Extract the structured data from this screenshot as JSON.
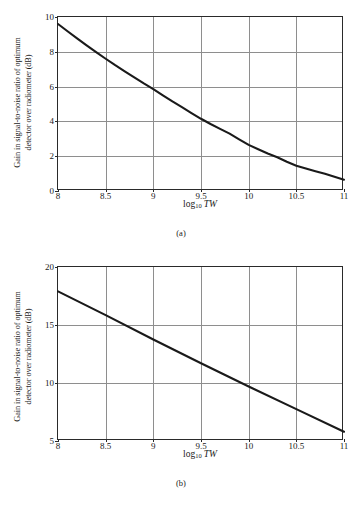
{
  "figure": {
    "panels": [
      {
        "id": "a",
        "caption": "(a)",
        "ylabel_line1": "Gain in signal-to-noise ratio of optimum",
        "ylabel_line2": "detector over radiometer (dB)",
        "xlabel_base": "log",
        "xlabel_sub": "10",
        "xlabel_var": "TW"
      },
      {
        "id": "b",
        "caption": "(b)",
        "ylabel_line1": "Gain in signal-to-noise ratio of optimum",
        "ylabel_line2": "detector over radiometer (dB)",
        "xlabel_base": "log",
        "xlabel_sub": "10",
        "xlabel_var": "TW"
      }
    ]
  },
  "chart_data": [
    {
      "type": "line",
      "panel": "a",
      "title": "",
      "xlabel": "log10 TW",
      "ylabel": "Gain in signal-to-noise ratio of optimum detector over radiometer (dB)",
      "xlim": [
        8,
        11
      ],
      "ylim": [
        0,
        10
      ],
      "xticks": [
        8,
        8.5,
        9,
        9.5,
        10,
        10.5,
        11
      ],
      "xticklabels": [
        "8",
        "8.5",
        "9",
        "9.5",
        "10",
        "10.5",
        "11"
      ],
      "yticks": [
        0,
        2,
        4,
        6,
        8,
        10
      ],
      "yticklabels": [
        "0",
        "2",
        "4",
        "6",
        "8",
        "10"
      ],
      "grid": true,
      "legend": null,
      "line_color": "#1a1a1a",
      "x": [
        8.0,
        8.1,
        8.2,
        8.3,
        8.4,
        8.5,
        8.6,
        8.7,
        8.8,
        8.9,
        9.0,
        9.1,
        9.2,
        9.3,
        9.4,
        9.5,
        9.6,
        9.7,
        9.8,
        9.9,
        10.0,
        10.1,
        10.2,
        10.3,
        10.4,
        10.5,
        10.6,
        10.7,
        10.8,
        10.9,
        11.0
      ],
      "y": [
        9.6,
        9.18,
        8.77,
        8.37,
        7.98,
        7.6,
        7.23,
        6.88,
        6.53,
        6.18,
        5.85,
        5.5,
        5.15,
        4.82,
        4.48,
        4.15,
        3.85,
        3.57,
        3.3,
        2.97,
        2.65,
        2.4,
        2.16,
        1.94,
        1.68,
        1.45,
        1.29,
        1.14,
        0.99,
        0.82,
        0.65
      ]
    },
    {
      "type": "line",
      "panel": "b",
      "title": "",
      "xlabel": "log10 TW",
      "ylabel": "Gain in signal-to-noise ratio of optimum detector over radiometer (dB)",
      "xlim": [
        8,
        11
      ],
      "ylim": [
        5,
        20
      ],
      "xticks": [
        8,
        8.5,
        9,
        9.5,
        10,
        10.5,
        11
      ],
      "xticklabels": [
        "8",
        "8.5",
        "9",
        "9.5",
        "10",
        "10.5",
        "11"
      ],
      "yticks": [
        5,
        10,
        15,
        20
      ],
      "yticklabels": [
        "5",
        "10",
        "15",
        "20"
      ],
      "grid": true,
      "legend": null,
      "line_color": "#1a1a1a",
      "x": [
        8.0,
        8.5,
        9.0,
        9.5,
        10.0,
        10.5,
        11.0
      ],
      "y": [
        17.9,
        15.85,
        13.75,
        11.7,
        9.7,
        7.75,
        5.8
      ]
    }
  ]
}
